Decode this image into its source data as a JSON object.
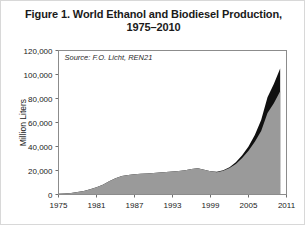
{
  "figure": {
    "title_line1": "Figure 1. World Ethanol and Biodiesel Production,",
    "title_line2": "1975–2010",
    "source_note": "Source: F.O. Licht, REN21",
    "border_color": "#d8d8d8",
    "background": "#ffffff"
  },
  "chart_data": {
    "type": "area",
    "stacked": true,
    "title": "Figure 1. World Ethanol and Biodiesel Production, 1975–2010",
    "xlabel": "",
    "ylabel": "Million Liters",
    "xlim": [
      1975,
      2011
    ],
    "ylim": [
      0,
      120000
    ],
    "grid": false,
    "legend_position": "none",
    "annotations": [
      "Source: F.O. Licht, REN21"
    ],
    "ytick_labels": [
      "0",
      "20,000",
      "40,000",
      "60,000",
      "80,000",
      "100,000",
      "120,000"
    ],
    "ytick_values": [
      0,
      20000,
      40000,
      60000,
      80000,
      100000,
      120000
    ],
    "xtick_labels": [
      "1975",
      "1981",
      "1987",
      "1993",
      "1999",
      "2005",
      "2011"
    ],
    "xtick_values": [
      1975,
      1981,
      1987,
      1993,
      1999,
      2005,
      2011
    ],
    "x": [
      1975,
      1976,
      1977,
      1978,
      1979,
      1980,
      1981,
      1982,
      1983,
      1984,
      1985,
      1986,
      1987,
      1988,
      1989,
      1990,
      1991,
      1992,
      1993,
      1994,
      1995,
      1996,
      1997,
      1998,
      1999,
      2000,
      2001,
      2002,
      2003,
      2004,
      2005,
      2006,
      2007,
      2008,
      2009,
      2010
    ],
    "series": [
      {
        "name": "Ethanol",
        "color": "#9a9a9a",
        "values": [
          600,
          900,
          1300,
          2000,
          3000,
          4300,
          6000,
          8200,
          11000,
          13500,
          15500,
          16200,
          16800,
          17300,
          17600,
          18000,
          18300,
          18700,
          19100,
          19600,
          20300,
          21200,
          21800,
          20700,
          19400,
          18600,
          19800,
          22000,
          25500,
          30500,
          36500,
          44000,
          53000,
          68000,
          76000,
          86000
        ],
        "color_name": "gray"
      },
      {
        "name": "Biodiesel",
        "color": "#101010",
        "values": [
          0,
          0,
          0,
          0,
          0,
          0,
          0,
          0,
          0,
          0,
          0,
          0,
          0,
          0,
          0,
          0,
          0,
          0,
          0,
          0,
          0,
          0,
          0,
          0,
          0,
          300,
          500,
          800,
          1300,
          2200,
          3500,
          5500,
          9000,
          13000,
          16000,
          19000
        ],
        "color_name": "black"
      }
    ],
    "total_values": [
      600,
      900,
      1300,
      2000,
      3000,
      4300,
      6000,
      8200,
      11000,
      13500,
      15500,
      16200,
      16800,
      17300,
      17600,
      18000,
      18300,
      18700,
      19100,
      19600,
      20300,
      21200,
      21800,
      20700,
      19400,
      18900,
      20300,
      22800,
      26800,
      32700,
      40000,
      49500,
      62000,
      81000,
      92000,
      105000
    ]
  }
}
